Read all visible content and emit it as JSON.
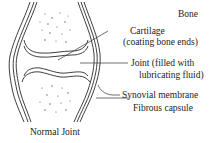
{
  "diagram": {
    "title": "Normal Joint",
    "labels": {
      "bone": "Bone",
      "cartilage_line1": "Cartilage",
      "cartilage_line2": "(coating bone ends)",
      "joint_line1": "Joint (filled with",
      "joint_line2": "lubricating fluid)",
      "synovial": "Synovial membrane",
      "capsule": "Fibrous capsule"
    },
    "colors": {
      "line": "#2a2a2a",
      "text": "#222222",
      "background": "#ffffff"
    }
  }
}
